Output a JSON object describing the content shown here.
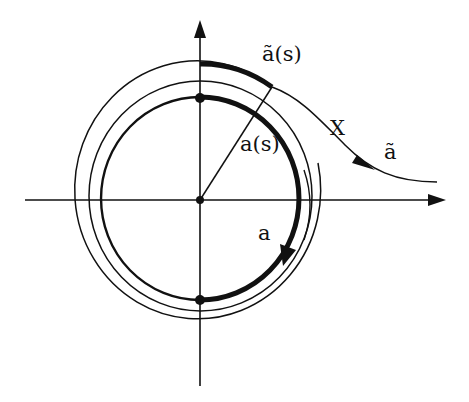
{
  "diagram": {
    "type": "topology-loop-lifting",
    "colors": {
      "ink": "#111111",
      "background": "#ffffff"
    },
    "labels": {
      "lifted_arc": "ã(s)",
      "path_X": "X",
      "lifted_path": "ã",
      "radius_point": "a(s)",
      "loop": "a"
    },
    "elements": {
      "axes": [
        "horizontal-axis-arrow",
        "vertical-axis-arrow"
      ],
      "circles": [
        "inner-thick-circle",
        "middle-circle",
        "outer-circle"
      ],
      "points": [
        "origin-point",
        "top-inner-point",
        "bottom-inner-point"
      ],
      "curves": [
        "path-X-with-arrow",
        "loop-a-arrow"
      ]
    }
  }
}
